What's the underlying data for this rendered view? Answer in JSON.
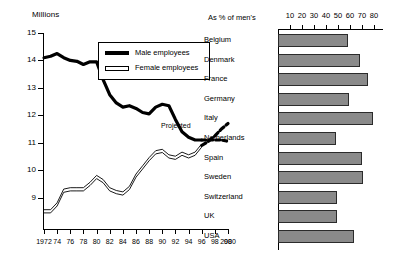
{
  "chart_data": [
    {
      "type": "line",
      "title": "Millions",
      "xlabel": "",
      "ylabel": "Millions",
      "ylim": [
        8,
        15
      ],
      "xlim": [
        1972,
        2000
      ],
      "grid": false,
      "legend_position": "top-center",
      "y_ticks": [
        "15",
        "14",
        "13",
        "12",
        "11",
        "10",
        "9"
      ],
      "x_ticks": [
        "1972",
        "74",
        "76",
        "78",
        "80",
        "82",
        "84",
        "86",
        "88",
        "90",
        "92",
        "94",
        "96",
        "98",
        "98",
        "2000"
      ],
      "annotations": [
        "Projected"
      ],
      "series": [
        {
          "name": "Male employees",
          "x": [
            1972,
            1973,
            1974,
            1975,
            1976,
            1977,
            1978,
            1979,
            1980,
            1981,
            1982,
            1983,
            1984,
            1985,
            1986,
            1987,
            1988,
            1989,
            1990,
            1991,
            1992,
            1993,
            1994,
            1995,
            1996
          ],
          "values": [
            14.1,
            14.15,
            14.25,
            14.1,
            14.0,
            13.97,
            13.85,
            13.95,
            13.95,
            13.3,
            12.75,
            12.45,
            12.3,
            12.35,
            12.25,
            12.1,
            12.05,
            12.3,
            12.4,
            12.35,
            11.85,
            11.4,
            11.2,
            11.1,
            11.1
          ]
        },
        {
          "name": "Male employees (projected)",
          "x": [
            1996,
            1997,
            1998,
            1999,
            2000
          ],
          "values": [
            11.1,
            11.1,
            11.1,
            11.1,
            11.05
          ]
        },
        {
          "name": "Female employees",
          "x": [
            1972,
            1973,
            1974,
            1975,
            1976,
            1977,
            1978,
            1979,
            1980,
            1981,
            1982,
            1983,
            1984,
            1985,
            1986,
            1987,
            1988,
            1989,
            1990,
            1991,
            1992,
            1993,
            1994,
            1995,
            1996
          ],
          "values": [
            8.5,
            8.5,
            8.75,
            9.25,
            9.3,
            9.3,
            9.3,
            9.5,
            9.75,
            9.6,
            9.3,
            9.2,
            9.15,
            9.35,
            9.8,
            10.1,
            10.4,
            10.65,
            10.7,
            10.5,
            10.45,
            10.6,
            10.5,
            10.6,
            10.9
          ]
        },
        {
          "name": "Female employees (projected)",
          "x": [
            1996,
            1997,
            1998,
            1999,
            2000
          ],
          "values": [
            10.9,
            11.05,
            11.25,
            11.5,
            11.7
          ]
        }
      ]
    },
    {
      "type": "bar",
      "orientation": "horizontal",
      "title": "As % of men's",
      "xlabel": "",
      "ylabel": "",
      "xlim": [
        0,
        80
      ],
      "x_ticks": [
        "10",
        "20",
        "30",
        "40",
        "50",
        "60",
        "70",
        "80"
      ],
      "categories": [
        "Belgium",
        "Denmark",
        "France",
        "Germany",
        "Italy",
        "Netherlands",
        "Spain",
        "Sweden",
        "Switzerland",
        "UK",
        "USA"
      ],
      "values": [
        58,
        68,
        75,
        59,
        79,
        48,
        70,
        71,
        49,
        49,
        63
      ]
    }
  ],
  "line_chart": {
    "axis_title": "Millions",
    "y_ticks": [
      "15",
      "14",
      "13",
      "12",
      "11",
      "10",
      "9"
    ],
    "x_ticks": [
      "1972",
      "74",
      "76",
      "78",
      "80",
      "82",
      "84",
      "86",
      "88",
      "90",
      "92",
      "94",
      "96",
      "98",
      "98",
      "2000"
    ],
    "legend": {
      "male_label": "Male employees",
      "female_label": "Female employees"
    },
    "projected_label": "Projected"
  },
  "bar_chart": {
    "caption": "As % of men's",
    "ticks": [
      "10",
      "20",
      "30",
      "40",
      "50",
      "60",
      "70",
      "80"
    ],
    "rows": [
      {
        "label": "Belgium",
        "value": 58
      },
      {
        "label": "Denmark",
        "value": 68
      },
      {
        "label": "France",
        "value": 75
      },
      {
        "label": "Germany",
        "value": 59
      },
      {
        "label": "Italy",
        "value": 79
      },
      {
        "label": "Netherlands",
        "value": 48
      },
      {
        "label": "Spain",
        "value": 70
      },
      {
        "label": "Sweden",
        "value": 71
      },
      {
        "label": "Switzerland",
        "value": 49
      },
      {
        "label": "UK",
        "value": 49
      },
      {
        "label": "USA",
        "value": 63
      }
    ]
  },
  "colors": {
    "bar_fill": "#8a8a8a",
    "bar_stroke": "#2b2b2b",
    "line_male": "#000000",
    "line_female": "#000000"
  }
}
